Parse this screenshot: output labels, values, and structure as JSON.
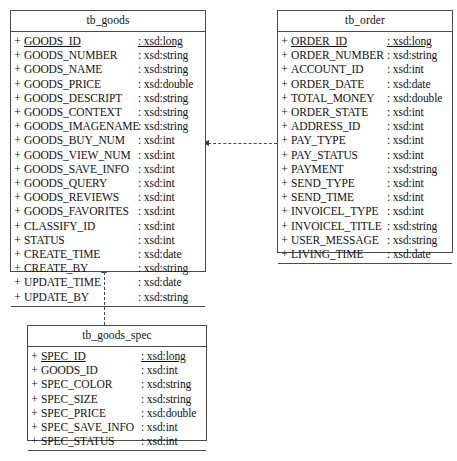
{
  "diagram": {
    "kind": "uml-class-diagram",
    "classes": [
      {
        "id": "tb_goods",
        "title": "tb_goods",
        "attributes": [
          {
            "visibility": "+",
            "name": "GOODS_ID",
            "sep": ":",
            "type": "xsd:long",
            "primary_key": true
          },
          {
            "visibility": "+",
            "name": "GOODS_NUMBER",
            "sep": ":",
            "type": "xsd:string",
            "primary_key": false
          },
          {
            "visibility": "+",
            "name": "GOODS_NAME",
            "sep": ":",
            "type": "xsd:string",
            "primary_key": false
          },
          {
            "visibility": "+",
            "name": "GOODS_PRICE",
            "sep": ":",
            "type": "xsd:double",
            "primary_key": false
          },
          {
            "visibility": "+",
            "name": "GOODS_DESCRIPT",
            "sep": ":",
            "type": "xsd:string",
            "primary_key": false
          },
          {
            "visibility": "+",
            "name": "GOODS_CONTEXT",
            "sep": ":",
            "type": "xsd:string",
            "primary_key": false
          },
          {
            "visibility": "+",
            "name": "GOODS_IMAGENAME",
            "sep": ":",
            "type": "xsd:string",
            "primary_key": false
          },
          {
            "visibility": "+",
            "name": "GOODS_BUY_NUM",
            "sep": ":",
            "type": "xsd:int",
            "primary_key": false
          },
          {
            "visibility": "+",
            "name": "GOODS_VIEW_NUM",
            "sep": ":",
            "type": "xsd:int",
            "primary_key": false
          },
          {
            "visibility": "+",
            "name": "GOODS_SAVE_INFO",
            "sep": ":",
            "type": "xsd:int",
            "primary_key": false
          },
          {
            "visibility": "+",
            "name": "GOODS_QUERY",
            "sep": ":",
            "type": "xsd:int",
            "primary_key": false
          },
          {
            "visibility": "+",
            "name": "GOODS_REVIEWS",
            "sep": ":",
            "type": "xsd:int",
            "primary_key": false
          },
          {
            "visibility": "+",
            "name": "GOODS_FAVORITES",
            "sep": ":",
            "type": "xsd:int",
            "primary_key": false
          },
          {
            "visibility": "+",
            "name": "CLASSIFY_ID",
            "sep": ":",
            "type": "xsd:int",
            "primary_key": false
          },
          {
            "visibility": "+",
            "name": "STATUS",
            "sep": ":",
            "type": "xsd:int",
            "primary_key": false
          },
          {
            "visibility": "+",
            "name": "CREATE_TIME",
            "sep": ":",
            "type": "xsd:date",
            "primary_key": false
          },
          {
            "visibility": "+",
            "name": "CREATE_BY",
            "sep": ":",
            "type": "xsd:string",
            "primary_key": false
          },
          {
            "visibility": "+",
            "name": "UPDATE_TIME",
            "sep": ":",
            "type": "xsd:date",
            "primary_key": false
          },
          {
            "visibility": "+",
            "name": "UPDATE_BY",
            "sep": ":",
            "type": "xsd:string",
            "primary_key": false
          }
        ],
        "methods": []
      },
      {
        "id": "tb_order",
        "title": "tb_order",
        "attributes": [
          {
            "visibility": "+",
            "name": "ORDER_ID",
            "sep": ":",
            "type": "xsd:long",
            "primary_key": true
          },
          {
            "visibility": "+",
            "name": "ORDER_NUMBER",
            "sep": ":",
            "type": "xsd:string",
            "primary_key": false
          },
          {
            "visibility": "+",
            "name": "ACCOUNT_ID",
            "sep": ":",
            "type": "xsd:int",
            "primary_key": false
          },
          {
            "visibility": "+",
            "name": "ORDER_DATE",
            "sep": ":",
            "type": "xsd:date",
            "primary_key": false
          },
          {
            "visibility": "+",
            "name": "TOTAL_MONEY",
            "sep": ":",
            "type": "xsd:double",
            "primary_key": false
          },
          {
            "visibility": "+",
            "name": "ORDER_STATE",
            "sep": ":",
            "type": "xsd:int",
            "primary_key": false
          },
          {
            "visibility": "+",
            "name": "ADDRESS_ID",
            "sep": ":",
            "type": "xsd:int",
            "primary_key": false
          },
          {
            "visibility": "+",
            "name": "PAY_TYPE",
            "sep": ":",
            "type": "xsd:int",
            "primary_key": false
          },
          {
            "visibility": "+",
            "name": "PAY_STATUS",
            "sep": ":",
            "type": "xsd:int",
            "primary_key": false
          },
          {
            "visibility": "+",
            "name": "PAYMENT",
            "sep": ":",
            "type": "xsd:string",
            "primary_key": false
          },
          {
            "visibility": "+",
            "name": "SEND_TYPE",
            "sep": ":",
            "type": "xsd:int",
            "primary_key": false
          },
          {
            "visibility": "+",
            "name": "SEND_TIME",
            "sep": ":",
            "type": "xsd:int",
            "primary_key": false
          },
          {
            "visibility": "+",
            "name": "INVOICEL_TYPE",
            "sep": ":",
            "type": "xsd:int",
            "primary_key": false
          },
          {
            "visibility": "+",
            "name": "INVOICEL_TITLE",
            "sep": ":",
            "type": "xsd:string",
            "primary_key": false
          },
          {
            "visibility": "+",
            "name": "USER_MESSAGE",
            "sep": ":",
            "type": "xsd:string",
            "primary_key": false
          },
          {
            "visibility": "+",
            "name": "LIVING_TIME",
            "sep": ":",
            "type": "xsd:date",
            "primary_key": false
          }
        ],
        "methods": []
      },
      {
        "id": "tb_goods_spec",
        "title": "tb_goods_spec",
        "attributes": [
          {
            "visibility": "+",
            "name": "SPEC_ID",
            "sep": ":",
            "type": "xsd:long",
            "primary_key": true
          },
          {
            "visibility": "+",
            "name": "GOODS_ID",
            "sep": ":",
            "type": "xsd:int",
            "primary_key": false
          },
          {
            "visibility": "+",
            "name": "SPEC_COLOR",
            "sep": ":",
            "type": "xsd:string",
            "primary_key": false
          },
          {
            "visibility": "+",
            "name": "SPEC_SIZE",
            "sep": ":",
            "type": "xsd:string",
            "primary_key": false
          },
          {
            "visibility": "+",
            "name": "SPEC_PRICE",
            "sep": ":",
            "type": "xsd:double",
            "primary_key": false
          },
          {
            "visibility": "+",
            "name": "SPEC_SAVE_INFO",
            "sep": ":",
            "type": "xsd:int",
            "primary_key": false
          },
          {
            "visibility": "+",
            "name": "SPEC_STATUS",
            "sep": ":",
            "type": "xsd:int",
            "primary_key": false
          }
        ],
        "methods": []
      }
    ],
    "relationships": [
      {
        "id": "order-to-goods",
        "style": "dashed",
        "arrow": "open-arrow-left",
        "from": "tb_order",
        "to": "tb_goods"
      },
      {
        "id": "goods-spec-to-goods",
        "style": "dashed",
        "arrow": "open-arrow-up",
        "from": "tb_goods_spec",
        "to": "tb_goods"
      }
    ]
  },
  "colors": {
    "border": "#4a4a4a",
    "background": "#ffffff",
    "text": "#111111",
    "connector": "#3a3a3a"
  }
}
